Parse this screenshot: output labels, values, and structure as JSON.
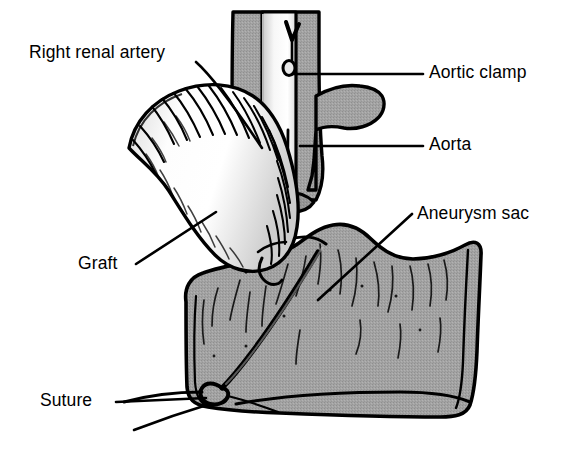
{
  "figure": {
    "kind": "medical-illustration",
    "width": 566,
    "height": 450,
    "background_color": "#ffffff"
  },
  "palette": {
    "outline": "#000000",
    "tissue_gray": "#a0a0a0",
    "tissue_gray_dark": "#8e8e8e",
    "graft_white": "#fbfbfb",
    "graft_shade": "#e2e2e2",
    "clamp_light": "#f2f2f2",
    "clamp_shade": "#d6d6d6",
    "label_color": "#000000",
    "leader_color": "#000000"
  },
  "labels": [
    {
      "id": "right-renal-artery",
      "text": "Right renal artery",
      "x": 29,
      "y": 44,
      "anchor": "left",
      "leader": "diagonal-down-right"
    },
    {
      "id": "aortic-clamp",
      "text": "Aortic clamp",
      "x": 429,
      "y": 64,
      "anchor": "left",
      "leader": "horizontal-left"
    },
    {
      "id": "aorta",
      "text": "Aorta",
      "x": 429,
      "y": 136,
      "anchor": "left",
      "leader": "horizontal-left"
    },
    {
      "id": "aneurysm-sac",
      "text": "Aneurysm sac",
      "x": 417,
      "y": 205,
      "anchor": "left",
      "leader": "diagonal-down-left"
    },
    {
      "id": "graft",
      "text": "Graft",
      "x": 78,
      "y": 255,
      "anchor": "left",
      "leader": "diagonal-up-right"
    },
    {
      "id": "suture",
      "text": "Suture",
      "x": 40,
      "y": 392,
      "anchor": "left",
      "leader": "horizontal-right"
    }
  ],
  "anatomy": {
    "aorta": {
      "name": "Aorta",
      "fill": "#a0a0a0",
      "description": "Vertical gray vessel trunk running top-centre downward into the aneurysm sac"
    },
    "aortic_clamp": {
      "name": "Aortic clamp",
      "fill": "#f2f2f2",
      "description": "Light vertical surgical clamp with circular hinge hole and jaws gripping the aorta"
    },
    "aneurysm_sac": {
      "name": "Aneurysm sac",
      "fill": "#a0a0a0",
      "description": "Large opened gray sac occupying the lower half of the figure with wall striations"
    },
    "graft": {
      "name": "Graft",
      "fill": "#fbfbfb",
      "description": "White corrugated tube graft curving from upper-left down to the anastomosis"
    },
    "right_renal_artery": {
      "name": "Right renal artery",
      "fill": "#a0a0a0",
      "description": "Gray branch leaving the aorta toward the upper left"
    },
    "suture": {
      "name": "Suture",
      "fill": "#000000",
      "description": "Dark thread passing through the sac wall with a knot loop at the lower tip"
    }
  }
}
